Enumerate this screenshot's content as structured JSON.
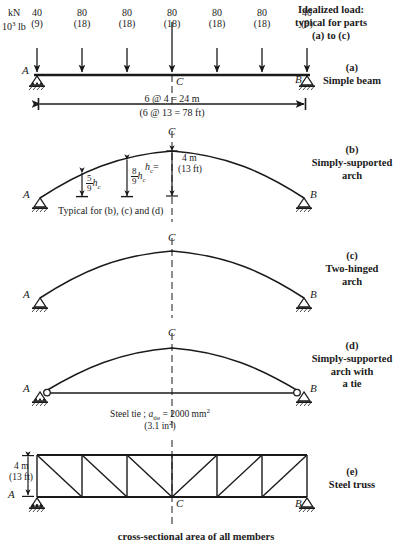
{
  "figure": {
    "units": {
      "metric": "kN",
      "imperial_pre": "10",
      "imperial_exp": "3",
      "imperial_post": " lb"
    },
    "load_header": {
      "line1": "Idealized load:",
      "line2": "typical for parts",
      "line3": "(a) to (c)"
    },
    "loads": [
      {
        "metric": "40",
        "imperial": "(9)"
      },
      {
        "metric": "80",
        "imperial": "(18)"
      },
      {
        "metric": "80",
        "imperial": "(18)"
      },
      {
        "metric": "80",
        "imperial": "(18)"
      },
      {
        "metric": "80",
        "imperial": "(18)"
      },
      {
        "metric": "80",
        "imperial": "(18)"
      },
      {
        "metric": "40",
        "imperial": "(9)"
      }
    ],
    "nodes": {
      "left": "A",
      "right": "B",
      "center": "C"
    },
    "span": {
      "metric": "6 @ 4 = 24 m",
      "imperial": "(6 @ 13 = 78 ft)"
    },
    "parts": [
      {
        "tag": "(a)",
        "name_line1": "Simple beam",
        "name_line2": "",
        "name_line3": ""
      },
      {
        "tag": "(b)",
        "name_line1": "Simply-supported",
        "name_line2": "arch",
        "name_line3": ""
      },
      {
        "tag": "(c)",
        "name_line1": "Two-hinged",
        "name_line2": "arch",
        "name_line3": ""
      },
      {
        "tag": "(d)",
        "name_line1": "Simply-supported",
        "name_line2": "arch with",
        "name_line3": "a tie"
      },
      {
        "tag": "(e)",
        "name_line1": "Steel truss",
        "name_line2": "",
        "name_line3": ""
      }
    ],
    "arch": {
      "rise_metric": "4 m",
      "rise_imperial": "(13 ft)",
      "rise_symbol_h": "h",
      "rise_symbol_sub": "c",
      "rise_eq": "=",
      "ord1_num": "5",
      "ord1_den": "9",
      "ord1_sym_h": "h",
      "ord1_sym_sub": "c",
      "ord2_num": "8",
      "ord2_den": "9",
      "ord2_sym_h": "h",
      "ord2_sym_sub": "c",
      "typical_note": "Typical for (b), (c) and (d)"
    },
    "tie": {
      "label_pre": "Steel tie ; ",
      "label_a": "a",
      "label_sub": "tie",
      "label_post": " = 2000 mm",
      "label_exp": "2",
      "imperial_pre": "(3.1 in",
      "imperial_exp": "2",
      "imperial_post": ")"
    },
    "truss": {
      "depth_metric": "4 m",
      "depth_imperial": "(13 ft)"
    },
    "footer": {
      "line1": "cross-sectional area of all members"
    },
    "colors": {
      "ink": "#1a1a1a",
      "line": "#262626"
    }
  }
}
